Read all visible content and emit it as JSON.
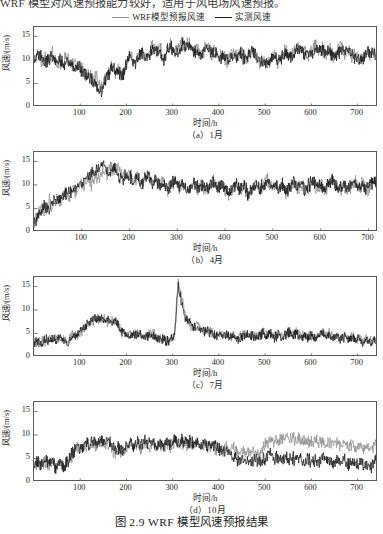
{
  "topline": "WRF 模型对风速预报能力较好，适用于风电场风速预报。",
  "legend": {
    "entries": [
      {
        "label": "WRF模型预报风速",
        "color": "#8c8c8c",
        "name": "legend-wrf"
      },
      {
        "label": "实测风速",
        "color": "#1a1a1a",
        "name": "legend-observed"
      }
    ]
  },
  "figure_title": "图 2.9   WRF 模型风速预报结果",
  "axis": {
    "ylabel": "风速/(m/s)",
    "xlabel": "时间/h",
    "yticks": [
      0,
      5,
      10,
      15
    ],
    "xticks": [
      100,
      200,
      300,
      400,
      500,
      600,
      700
    ],
    "ylim": [
      0,
      17
    ],
    "xlim": [
      0,
      744
    ]
  },
  "panels": [
    {
      "id": "a",
      "caption": "（a）1月"
    },
    {
      "id": "b",
      "caption": "（b）4月"
    },
    {
      "id": "c",
      "caption": "（c）7月"
    },
    {
      "id": "d",
      "caption": "（d）10月"
    }
  ],
  "chart_data": [
    {
      "type": "line",
      "title": "（a）1月",
      "xlabel": "时间/h",
      "ylabel": "风速/(m/s)",
      "xlim": [
        0,
        744
      ],
      "ylim": [
        0,
        17
      ],
      "xticks": [
        100,
        200,
        300,
        400,
        500,
        600,
        700
      ],
      "yticks": [
        0,
        5,
        10,
        15
      ],
      "grid": false,
      "legend_position": "top-center",
      "x": [
        0,
        8,
        16,
        24,
        32,
        40,
        48,
        56,
        64,
        72,
        80,
        88,
        96,
        104,
        112,
        120,
        128,
        136,
        144,
        152,
        160,
        168,
        176,
        184,
        192,
        200,
        208,
        216,
        224,
        232,
        240,
        248,
        256,
        264,
        272,
        280,
        288,
        296,
        304,
        312,
        320,
        328,
        336,
        344,
        352,
        360,
        368,
        376,
        384,
        392,
        400,
        408,
        416,
        424,
        432,
        440,
        448,
        456,
        464,
        472,
        480,
        488,
        496,
        504,
        512,
        520,
        528,
        536,
        544,
        552,
        560,
        568,
        576,
        584,
        592,
        600,
        608,
        616,
        624,
        632,
        640,
        648,
        656,
        664,
        672,
        680,
        688,
        696,
        704,
        712,
        720,
        728,
        736,
        744
      ],
      "series": [
        {
          "name": "WRF模型预报风速",
          "color": "#8c8c8c",
          "values": [
            10.2,
            11.3,
            9.6,
            10.8,
            9.1,
            11.6,
            10.0,
            8.6,
            9.9,
            11.1,
            8.4,
            9.3,
            7.8,
            8.9,
            6.4,
            7.3,
            5.2,
            6.8,
            4.1,
            5.6,
            7.4,
            9.2,
            7.1,
            8.5,
            6.2,
            9.8,
            11.4,
            9.0,
            10.6,
            12.3,
            10.1,
            11.8,
            13.4,
            11.2,
            12.8,
            10.4,
            11.9,
            13.6,
            11.5,
            12.2,
            14.1,
            12.6,
            13.9,
            11.4,
            12.7,
            10.9,
            12.1,
            13.3,
            11.0,
            12.4,
            10.2,
            11.6,
            9.4,
            10.8,
            12.0,
            10.3,
            11.7,
            9.8,
            11.1,
            12.5,
            10.6,
            9.2,
            10.4,
            8.7,
            9.9,
            11.3,
            9.5,
            10.7,
            12.2,
            10.0,
            11.4,
            13.0,
            11.6,
            12.4,
            10.8,
            12.0,
            13.5,
            11.8,
            12.9,
            11.2,
            12.6,
            10.5,
            11.9,
            13.2,
            11.4,
            12.1,
            10.3,
            11.5,
            9.8,
            10.9,
            12.3,
            10.6,
            11.8,
            10.4
          ]
        },
        {
          "name": "实测风速",
          "color": "#1a1a1a",
          "values": [
            9.8,
            10.6,
            11.2,
            9.4,
            10.1,
            10.9,
            9.2,
            10.4,
            8.8,
            10.2,
            9.0,
            8.2,
            8.9,
            7.6,
            7.0,
            6.2,
            5.8,
            4.6,
            3.2,
            4.8,
            6.6,
            8.4,
            7.8,
            7.2,
            6.8,
            9.0,
            10.8,
            9.6,
            9.8,
            11.4,
            10.6,
            11.0,
            12.6,
            12.0,
            11.6,
            9.8,
            12.4,
            12.8,
            12.0,
            11.8,
            13.2,
            13.0,
            12.8,
            12.2,
            11.6,
            11.2,
            12.6,
            12.0,
            11.8,
            11.4,
            10.6,
            10.8,
            10.0,
            10.2,
            11.2,
            10.8,
            11.0,
            10.4,
            10.6,
            11.8,
            11.0,
            9.8,
            9.6,
            9.2,
            10.2,
            10.6,
            10.0,
            10.2,
            11.4,
            10.6,
            10.8,
            12.2,
            12.0,
            11.6,
            11.4,
            11.2,
            12.4,
            12.2,
            12.0,
            11.8,
            11.6,
            11.0,
            11.2,
            12.0,
            11.8,
            11.4,
            10.8,
            10.6,
            10.2,
            10.4,
            11.6,
            11.2,
            11.0,
            10.8
          ]
        }
      ]
    },
    {
      "type": "line",
      "title": "（b）4月",
      "xlabel": "时间/h",
      "ylabel": "风速/(m/s)",
      "xlim": [
        0,
        720
      ],
      "ylim": [
        0,
        17
      ],
      "xticks": [
        100,
        200,
        300,
        400,
        500,
        600,
        700
      ],
      "yticks": [
        0,
        5,
        10,
        15
      ],
      "grid": false,
      "series": [
        {
          "name": "WRF模型预报风速",
          "color": "#8c8c8c",
          "values": [
            2.4,
            3.8,
            5.2,
            4.1,
            6.4,
            5.0,
            7.2,
            6.1,
            8.4,
            7.0,
            9.2,
            8.1,
            10.4,
            9.0,
            11.2,
            10.1,
            12.4,
            11.0,
            13.2,
            12.1,
            14.0,
            12.8,
            13.6,
            12.2,
            11.4,
            12.6,
            10.8,
            11.9,
            9.6,
            10.8,
            12.0,
            10.2,
            11.4,
            9.8,
            10.6,
            8.9,
            9.8,
            11.2,
            9.4,
            10.6,
            8.2,
            9.4,
            10.8,
            9.0,
            10.2,
            8.6,
            9.8,
            11.0,
            9.2,
            10.4,
            8.8,
            7.6,
            8.9,
            10.2,
            8.4,
            9.6,
            7.8,
            9.0,
            10.4,
            8.6,
            9.8,
            11.2,
            9.4,
            10.6,
            8.8,
            10.0,
            8.2,
            9.4,
            10.8,
            9.0,
            10.2,
            8.4,
            9.6,
            11.0,
            9.2,
            10.4,
            8.6,
            9.8,
            11.2,
            9.4,
            8.6,
            10.0,
            8.8,
            9.6,
            11.0,
            9.2,
            10.4,
            8.6,
            9.8,
            11.2,
            10.4
          ]
        },
        {
          "name": "实测风速",
          "color": "#1a1a1a",
          "values": [
            1.8,
            3.0,
            4.4,
            5.6,
            5.0,
            6.2,
            6.8,
            7.4,
            7.8,
            8.6,
            9.0,
            9.8,
            10.2,
            11.0,
            11.6,
            12.2,
            12.8,
            13.4,
            14.6,
            13.2,
            12.6,
            13.8,
            12.0,
            11.2,
            12.4,
            11.6,
            10.4,
            11.8,
            10.0,
            11.2,
            11.8,
            10.6,
            11.0,
            10.2,
            9.8,
            9.2,
            10.4,
            10.8,
            9.6,
            10.2,
            8.8,
            9.8,
            10.4,
            9.4,
            9.8,
            9.0,
            10.2,
            10.6,
            9.6,
            10.0,
            9.2,
            8.0,
            9.4,
            10.0,
            8.8,
            9.8,
            8.2,
            9.4,
            10.2,
            9.0,
            10.0,
            10.8,
            9.8,
            10.2,
            9.2,
            10.4,
            8.6,
            9.8,
            10.6,
            9.4,
            10.0,
            8.8,
            10.2,
            10.6,
            9.6,
            10.0,
            9.0,
            10.2,
            10.8,
            9.8,
            9.0,
            10.4,
            9.2,
            10.0,
            10.6,
            9.6,
            10.2,
            9.0,
            10.2,
            10.8,
            10.2
          ]
        }
      ]
    },
    {
      "type": "line",
      "title": "（c）7月",
      "xlabel": "时间/h",
      "ylabel": "风速/(m/s)",
      "xlim": [
        0,
        744
      ],
      "ylim": [
        0,
        17
      ],
      "xticks": [
        100,
        200,
        300,
        400,
        500,
        600,
        700
      ],
      "yticks": [
        0,
        5,
        10,
        15
      ],
      "grid": false,
      "annotations": [
        {
          "text": "峰值",
          "x": 200,
          "y": 16.8
        }
      ],
      "series": [
        {
          "name": "WRF模型预报风速",
          "color": "#8c8c8c",
          "values": [
            3.2,
            2.6,
            3.8,
            3.0,
            4.2,
            3.4,
            4.6,
            3.8,
            4.0,
            3.2,
            4.4,
            5.0,
            4.2,
            5.4,
            6.2,
            7.0,
            7.8,
            8.4,
            7.6,
            8.2,
            7.4,
            8.0,
            7.2,
            6.4,
            5.6,
            4.8,
            5.4,
            4.6,
            5.2,
            4.4,
            3.8,
            4.6,
            5.2,
            4.4,
            3.6,
            4.2,
            3.4,
            4.0,
            4.8,
            16.8,
            12.4,
            8.6,
            7.2,
            6.4,
            7.0,
            6.2,
            5.4,
            6.0,
            5.2,
            4.6,
            5.2,
            4.4,
            5.0,
            4.2,
            4.8,
            4.0,
            4.6,
            5.2,
            4.4,
            5.0,
            4.2,
            4.8,
            5.4,
            4.6,
            5.2,
            4.4,
            5.0,
            4.2,
            4.8,
            5.4,
            4.6,
            5.2,
            4.4,
            5.0,
            4.2,
            4.8,
            4.0,
            4.6,
            5.2,
            4.4,
            5.0,
            4.2,
            4.8,
            4.0,
            4.6,
            3.8,
            4.4,
            3.6,
            4.2,
            3.4,
            4.0,
            3.2,
            3.8,
            3.4
          ]
        },
        {
          "name": "实测风速",
          "color": "#1a1a1a",
          "values": [
            2.8,
            3.4,
            2.6,
            3.8,
            3.2,
            4.0,
            3.4,
            4.2,
            3.6,
            2.8,
            4.0,
            4.6,
            5.2,
            6.0,
            6.8,
            7.4,
            8.2,
            7.8,
            8.6,
            7.6,
            8.4,
            7.0,
            7.8,
            6.2,
            5.4,
            5.0,
            4.4,
            5.0,
            4.2,
            4.8,
            4.0,
            4.4,
            4.8,
            4.0,
            3.4,
            4.0,
            3.2,
            3.8,
            4.4,
            15.2,
            11.0,
            8.0,
            7.6,
            6.0,
            6.6,
            5.8,
            5.2,
            5.6,
            4.8,
            4.4,
            5.0,
            4.2,
            4.8,
            4.0,
            4.6,
            3.8,
            4.4,
            5.0,
            4.2,
            4.8,
            4.0,
            4.6,
            5.2,
            4.4,
            5.0,
            4.2,
            4.8,
            4.0,
            4.6,
            5.2,
            4.4,
            5.0,
            4.2,
            4.8,
            4.0,
            4.6,
            3.8,
            4.4,
            5.0,
            4.2,
            4.8,
            4.0,
            4.6,
            3.8,
            4.4,
            3.6,
            4.2,
            3.4,
            4.0,
            3.2,
            3.8,
            3.0,
            3.6,
            3.2
          ]
        }
      ]
    },
    {
      "type": "line",
      "title": "（d）10月",
      "xlabel": "时间/h",
      "ylabel": "风速/(m/s)",
      "xlim": [
        0,
        744
      ],
      "ylim": [
        0,
        17
      ],
      "xticks": [
        100,
        200,
        300,
        400,
        500,
        600,
        700
      ],
      "yticks": [
        0,
        5,
        10,
        15
      ],
      "grid": false,
      "note": "WRF 预报值在 550 h 之后明显高于实测值",
      "series": [
        {
          "name": "WRF模型预报风速",
          "color": "#8c8c8c",
          "values": [
            3.4,
            4.2,
            3.6,
            4.6,
            3.8,
            4.4,
            3.2,
            4.0,
            3.4,
            4.2,
            5.0,
            6.2,
            7.4,
            6.6,
            7.8,
            7.0,
            8.2,
            7.4,
            8.6,
            7.8,
            8.0,
            7.2,
            6.4,
            7.0,
            6.2,
            7.4,
            8.2,
            7.4,
            8.0,
            7.2,
            8.4,
            7.6,
            8.2,
            7.4,
            8.0,
            7.2,
            8.4,
            7.6,
            8.8,
            8.0,
            8.6,
            7.8,
            8.4,
            7.6,
            8.2,
            7.4,
            8.0,
            7.2,
            7.8,
            7.0,
            7.6,
            6.8,
            7.4,
            6.6,
            7.2,
            6.4,
            7.0,
            6.2,
            6.8,
            6.0,
            6.6,
            5.8,
            7.2,
            8.4,
            9.0,
            8.2,
            9.4,
            8.6,
            9.8,
            9.0,
            9.6,
            8.8,
            9.4,
            8.6,
            9.2,
            8.4,
            9.0,
            8.2,
            8.8,
            8.0,
            8.6,
            7.8,
            8.4,
            7.6,
            8.2,
            7.4,
            8.0,
            7.2,
            7.8,
            7.0,
            7.6,
            6.8,
            7.4,
            8.0
          ]
        },
        {
          "name": "实测风速",
          "color": "#1a1a1a",
          "values": [
            3.0,
            4.6,
            3.2,
            5.0,
            3.4,
            4.8,
            2.8,
            4.4,
            3.0,
            4.6,
            5.4,
            6.8,
            7.8,
            7.0,
            8.4,
            7.6,
            8.8,
            8.0,
            9.2,
            8.2,
            8.4,
            7.6,
            6.8,
            7.4,
            6.6,
            7.8,
            8.6,
            7.8,
            8.4,
            7.6,
            8.8,
            8.0,
            8.6,
            7.8,
            8.4,
            7.6,
            8.8,
            8.0,
            9.2,
            8.4,
            9.0,
            8.2,
            8.8,
            8.0,
            8.6,
            7.8,
            8.4,
            7.6,
            8.2,
            7.4,
            7.0,
            6.2,
            6.8,
            6.0,
            5.4,
            4.6,
            5.2,
            4.4,
            5.0,
            4.2,
            4.8,
            4.0,
            4.6,
            5.2,
            5.8,
            5.0,
            5.6,
            4.8,
            5.4,
            4.6,
            5.2,
            4.4,
            5.0,
            4.2,
            4.8,
            4.0,
            4.6,
            3.8,
            5.0,
            4.2,
            4.8,
            4.0,
            4.6,
            3.8,
            4.4,
            3.6,
            4.2,
            3.4,
            4.0,
            3.2,
            3.8,
            3.0,
            4.4,
            5.6
          ]
        }
      ]
    }
  ]
}
